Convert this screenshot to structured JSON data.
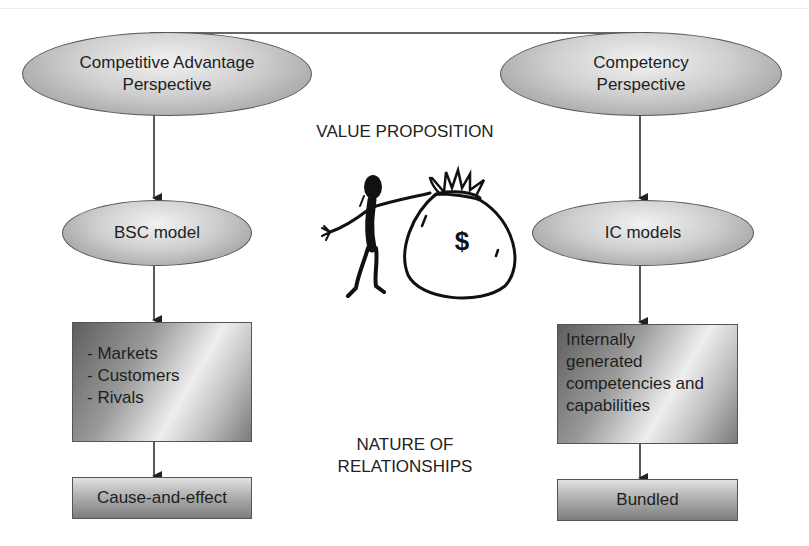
{
  "left_column": {
    "perspective": [
      "Competitive Advantage",
      "Perspective"
    ],
    "model": "BSC model",
    "factors": [
      "- Markets",
      "- Customers",
      "- Rivals"
    ],
    "relationship": "Cause-and-effect"
  },
  "right_column": {
    "perspective": [
      "Competency",
      "Perspective"
    ],
    "model": "IC models",
    "factors": [
      "Internally",
      "generated",
      "competencies and",
      "capabilities"
    ],
    "relationship": "Bundled"
  },
  "center": {
    "value_label": "VALUE PROPOSITION",
    "illustration": "person-with-money-bag-icon",
    "money_symbol": "$",
    "nature_label": [
      "NATURE OF",
      "RELATIONSHIPS"
    ]
  }
}
